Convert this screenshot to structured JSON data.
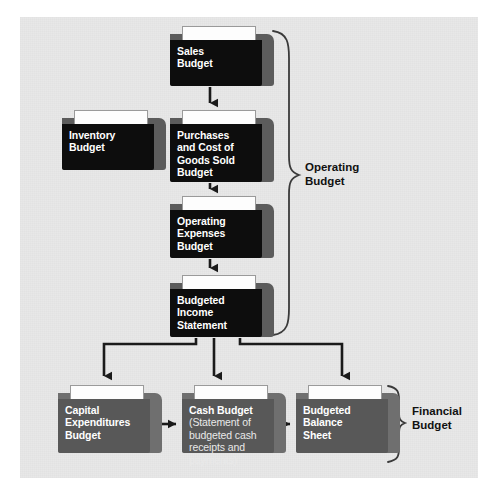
{
  "diagram": {
    "background_color": "#e8e8e8",
    "folders": [
      {
        "id": "sales-budget",
        "label": "Sales\nBudget",
        "sub": "",
        "style": "dark",
        "x": 170,
        "y": 26,
        "w": 104,
        "h": 60
      },
      {
        "id": "inventory-budget",
        "label": "Inventory\nBudget",
        "sub": "",
        "style": "dark",
        "x": 62,
        "y": 110,
        "w": 104,
        "h": 60
      },
      {
        "id": "purchases-and-cost-of-goods-sold-budget",
        "label": "Purchases\nand Cost of\nGoods Sold\nBudget",
        "sub": "",
        "style": "dark",
        "x": 170,
        "y": 110,
        "w": 104,
        "h": 72
      },
      {
        "id": "operating-expenses-budget",
        "label": "Operating\nExpenses\nBudget",
        "sub": "",
        "style": "dark",
        "x": 170,
        "y": 196,
        "w": 104,
        "h": 62
      },
      {
        "id": "budgeted-income-statement",
        "label": "Budgeted\nIncome\nStatement",
        "sub": "",
        "style": "dark",
        "x": 170,
        "y": 275,
        "w": 104,
        "h": 62
      },
      {
        "id": "capital-expenditures-budget",
        "label": "Capital\nExpenditures\nBudget",
        "sub": "",
        "style": "gray",
        "x": 58,
        "y": 385,
        "w": 104,
        "h": 68
      },
      {
        "id": "cash-budget",
        "label": "Cash Budget",
        "sub": "(Statement of\nbudgeted cash\nreceipts and\npayments)",
        "style": "gray",
        "x": 182,
        "y": 385,
        "w": 104,
        "h": 68
      },
      {
        "id": "budgeted-balance-sheet",
        "label": "Budgeted\nBalance\nSheet",
        "sub": "",
        "style": "gray",
        "x": 296,
        "y": 385,
        "w": 104,
        "h": 68
      }
    ],
    "group_labels": [
      {
        "id": "operating-budget",
        "text": "Operating\nBudget",
        "x": 305,
        "y": 160
      },
      {
        "id": "financial-budget",
        "text": "Financial\nBudget",
        "x": 412,
        "y": 404
      }
    ],
    "connector_color": "#1a1a1a",
    "brace_color": "#3a3a3a"
  }
}
